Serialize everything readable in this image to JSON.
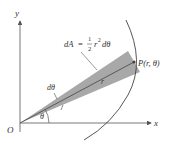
{
  "diagram": {
    "axes": {
      "x_label": "x",
      "y_label": "y",
      "origin_label": "O"
    },
    "formula": {
      "lhs": "dA",
      "equals": "=",
      "frac_num": "1",
      "frac_den": "2",
      "rhs": "r",
      "exponent": "2",
      "tail": "dθ"
    },
    "point_label": "P(r, θ)",
    "radius_label": "r",
    "dtheta_label": "dθ",
    "theta_label": "θ",
    "colors": {
      "axis": "#555555",
      "wedge_fill": "#a8a8a8",
      "curve": "#444444",
      "text": "#333333",
      "point": "#444444"
    }
  }
}
